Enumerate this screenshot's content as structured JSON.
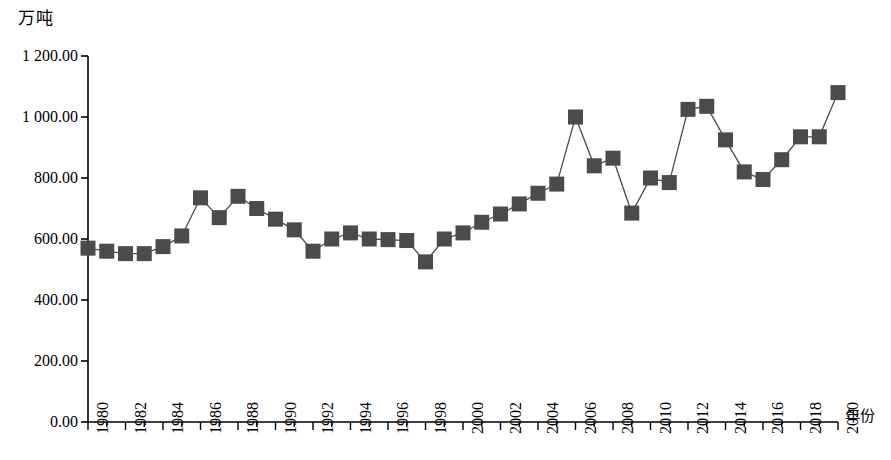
{
  "chart_data": {
    "type": "line",
    "title": "",
    "subtitle": "",
    "ylabel": "万吨",
    "xlabel": "年份",
    "legend": [],
    "legend_position": "none",
    "grid": false,
    "ylim": [
      0,
      1200
    ],
    "xlim": [
      1980,
      2020
    ],
    "ytick_labels": [
      "0.00",
      "200.00",
      "400.00",
      "600.00",
      "800.00",
      "1 000.00",
      "1 200.00"
    ],
    "ytick_values": [
      0,
      200,
      400,
      600,
      800,
      1000,
      1200
    ],
    "xtick_labels": [
      "1980",
      "1982",
      "1984",
      "1986",
      "1988",
      "1990",
      "1992",
      "1994",
      "1996",
      "1998",
      "2000",
      "2002",
      "2004",
      "2006",
      "2008",
      "2010",
      "2012",
      "2014",
      "2016",
      "2018",
      "2020"
    ],
    "xtick_values": [
      1980,
      1982,
      1984,
      1986,
      1988,
      1990,
      1992,
      1994,
      1996,
      1998,
      2000,
      2002,
      2004,
      2006,
      2008,
      2010,
      2012,
      2014,
      2016,
      2018,
      2020
    ],
    "x": [
      1980,
      1981,
      1982,
      1983,
      1984,
      1985,
      1986,
      1987,
      1988,
      1989,
      1990,
      1991,
      1992,
      1993,
      1994,
      1995,
      1996,
      1997,
      1998,
      1999,
      2000,
      2001,
      2002,
      2003,
      2004,
      2005,
      2006,
      2007,
      2008,
      2009,
      2010,
      2011,
      2012,
      2013,
      2014,
      2015,
      2016,
      2017,
      2018,
      2019,
      2020
    ],
    "values": [
      570,
      560,
      552,
      552,
      575,
      610,
      735,
      670,
      740,
      700,
      665,
      630,
      560,
      600,
      620,
      600,
      598,
      595,
      525,
      600,
      620,
      655,
      682,
      715,
      750,
      780,
      1000,
      840,
      865,
      685,
      800,
      785,
      1025,
      1035,
      925,
      820,
      795,
      860,
      935,
      935,
      1080
    ],
    "series": [
      {
        "name": "产量",
        "marker": "square",
        "color": "#4b4b4b",
        "values": [
          570,
          560,
          552,
          552,
          575,
          610,
          735,
          670,
          740,
          700,
          665,
          630,
          560,
          600,
          620,
          600,
          598,
          595,
          525,
          600,
          620,
          655,
          682,
          715,
          750,
          780,
          1000,
          840,
          865,
          685,
          800,
          785,
          1025,
          1035,
          925,
          820,
          795,
          860,
          935,
          935,
          1080
        ]
      }
    ],
    "colors": {
      "marker": "#4b4b4b",
      "line": "#4b4b4b",
      "axis": "#000000",
      "background": "#ffffff"
    }
  }
}
